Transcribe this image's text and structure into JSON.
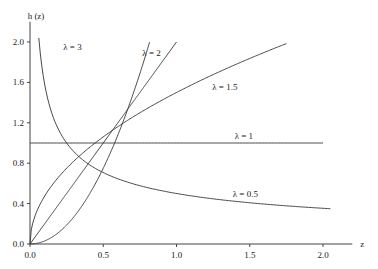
{
  "chart_data": {
    "type": "line",
    "title": "",
    "xlabel": "z",
    "ylabel": "h (z)",
    "xlim": [
      0,
      2.2
    ],
    "ylim": [
      0,
      2.2
    ],
    "x_ticks": [
      0.0,
      0.5,
      1.0,
      1.5,
      2.0
    ],
    "x_tick_labels": [
      "0.0",
      "0.5",
      "1.0",
      "1.5",
      "2.0"
    ],
    "y_ticks": [
      0.0,
      0.4,
      0.8,
      1.2,
      1.6,
      2.0
    ],
    "y_tick_labels": [
      "0.0",
      "0.4",
      "0.8",
      "1.2",
      "1.6",
      "2.0"
    ],
    "grid": false,
    "legend": "inline labels",
    "series": [
      {
        "name": "λ = 3",
        "lambda": 3,
        "x_range": [
          0,
          0.816
        ],
        "label_pos": [
          0.29,
          1.92
        ]
      },
      {
        "name": "λ = 2",
        "lambda": 2,
        "x_range": [
          0,
          1.0
        ],
        "label_pos": [
          0.83,
          1.86
        ]
      },
      {
        "name": "λ = 1.5",
        "lambda": 1.5,
        "x_range": [
          0,
          1.75
        ],
        "label_pos": [
          1.33,
          1.52
        ]
      },
      {
        "name": "λ = 1",
        "lambda": 1,
        "x_range": [
          0,
          2.0
        ],
        "label_pos": [
          1.46,
          1.04
        ]
      },
      {
        "name": "λ = 0.5",
        "lambda": 0.5,
        "x_range": [
          0.06,
          2.05
        ],
        "label_pos": [
          1.47,
          0.47
        ]
      }
    ]
  }
}
